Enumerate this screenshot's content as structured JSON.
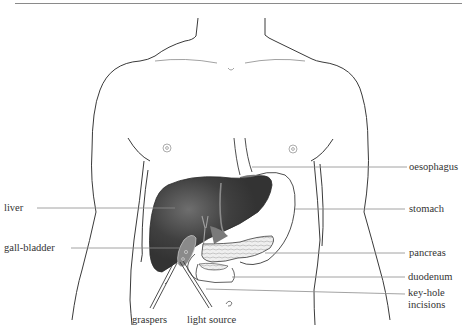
{
  "diagram": {
    "type": "anatomical-illustration",
    "colors": {
      "outline": "#3a3a3a",
      "liver": "#3b3b3b",
      "liver_highlight": "#6a6a6a",
      "stomach_shaded": "#7a7a7a",
      "pancreas_fill": "#ececec",
      "leader_line": "#8c8c8c",
      "label_text": "#333333",
      "rule": "#8a8a8a"
    }
  },
  "labels": {
    "left": [
      {
        "id": "liver",
        "text": "liver"
      },
      {
        "id": "gall-bladder",
        "text": "gall-bladder"
      }
    ],
    "right": [
      {
        "id": "oesophagus",
        "text": "oesophagus"
      },
      {
        "id": "stomach",
        "text": "stomach"
      },
      {
        "id": "pancreas",
        "text": "pancreas"
      },
      {
        "id": "duodenum",
        "text": "duodenum"
      },
      {
        "id": "key-hole-incisions",
        "text": "key-hole\nincisions"
      }
    ],
    "bottom": [
      {
        "id": "graspers",
        "text": "graspers"
      },
      {
        "id": "light-source",
        "text": "light source"
      }
    ]
  }
}
